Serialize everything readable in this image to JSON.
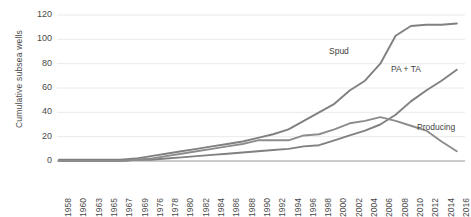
{
  "chart_data": {
    "type": "line",
    "title": "",
    "xlabel": "",
    "ylabel": "Cumulative subsea wells",
    "ylim": [
      0,
      120
    ],
    "yticks": [
      0,
      20,
      40,
      60,
      80,
      100,
      120
    ],
    "grid": true,
    "legend_position": "inline-annotations",
    "categories": [
      "1958",
      "1960",
      "1963",
      "1965",
      "1967",
      "1969",
      "1976",
      "1978",
      "1980",
      "1982",
      "1984",
      "1986",
      "1988",
      "1990",
      "1992",
      "1994",
      "1996",
      "1998",
      "2000",
      "2002",
      "2004",
      "2006",
      "2008",
      "2010",
      "2012",
      "2014",
      "2016"
    ],
    "series": [
      {
        "name": "Spud",
        "color": "#808080",
        "values": [
          1,
          1,
          1,
          1,
          1,
          2,
          4,
          6,
          8,
          10,
          12,
          14,
          16,
          19,
          22,
          26,
          33,
          40,
          47,
          58,
          66,
          80,
          103,
          111,
          112,
          112,
          113
        ]
      },
      {
        "name": "PA + TA",
        "color": "#808080",
        "values": [
          0,
          0,
          0,
          0,
          0,
          1,
          1,
          2,
          3,
          4,
          5,
          6,
          7,
          8,
          9,
          10,
          12,
          13,
          17,
          21,
          25,
          30,
          38,
          49,
          58,
          66,
          75
        ]
      },
      {
        "name": "Producing",
        "color": "#8c8c8c",
        "values": [
          0,
          0,
          0,
          0,
          0,
          1,
          2,
          4,
          6,
          8,
          10,
          12,
          14,
          17,
          17,
          17,
          21,
          22,
          26,
          31,
          33,
          36,
          33,
          29,
          25,
          16,
          8
        ]
      }
    ]
  },
  "axis": {
    "y_title": "Cumulative subsea wells",
    "y_labels": [
      "120",
      "100",
      "80",
      "60",
      "40",
      "20",
      "0"
    ],
    "x_labels": [
      "1958",
      "1960",
      "1963",
      "1965",
      "1967",
      "1969",
      "1976",
      "1978",
      "1980",
      "1982",
      "1984",
      "1986",
      "1988",
      "1990",
      "1992",
      "1994",
      "1996",
      "1998",
      "2000",
      "2002",
      "2004",
      "2006",
      "2008",
      "2010",
      "2012",
      "2014",
      "2016"
    ]
  },
  "annotations": [
    {
      "name": "spud",
      "label": "Spud"
    },
    {
      "name": "pa-ta",
      "label": "PA + TA"
    },
    {
      "name": "producing",
      "label": "Producing"
    }
  ],
  "colors": {
    "line": "#808080",
    "grid": "#e8e8e8",
    "text": "#4a4a4a"
  }
}
